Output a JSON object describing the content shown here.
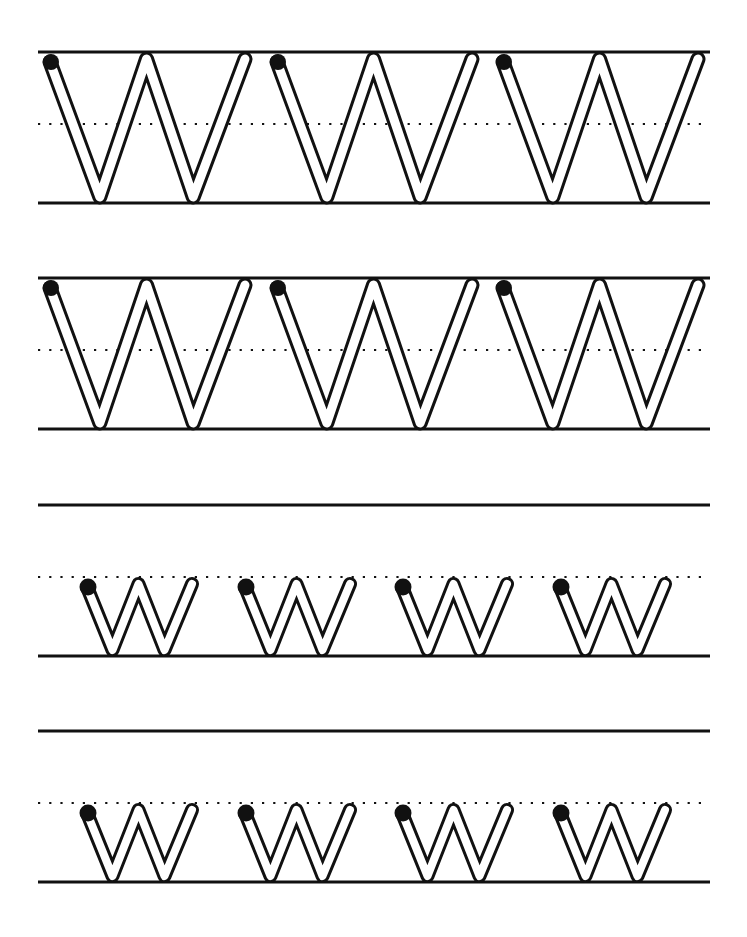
{
  "worksheet": {
    "title": "Letter W tracing practice",
    "letter_upper": "W",
    "letter_lower": "w",
    "ink_color": "#111111",
    "paper_color": "#ffffff",
    "rows": [
      {
        "type": "uppercase",
        "top": 52,
        "mid": 124,
        "base": 203,
        "count": 3,
        "letters_x": [
          45,
          272,
          498
        ],
        "letter_width": 203
      },
      {
        "type": "uppercase",
        "top": 278,
        "mid": 350,
        "base": 429,
        "count": 3,
        "letters_x": [
          45,
          272,
          498
        ],
        "letter_width": 203
      },
      {
        "type": "lowercase",
        "top": 505,
        "mid": 577,
        "base": 656,
        "count": 4,
        "letters_x": [
          82,
          240,
          397,
          555
        ],
        "letter_width": 113
      },
      {
        "type": "lowercase",
        "top": 731,
        "mid": 803,
        "base": 882,
        "count": 4,
        "letters_x": [
          82,
          240,
          397,
          555
        ],
        "letter_width": 113
      }
    ],
    "line_x_start": 38,
    "line_x_end": 710
  }
}
